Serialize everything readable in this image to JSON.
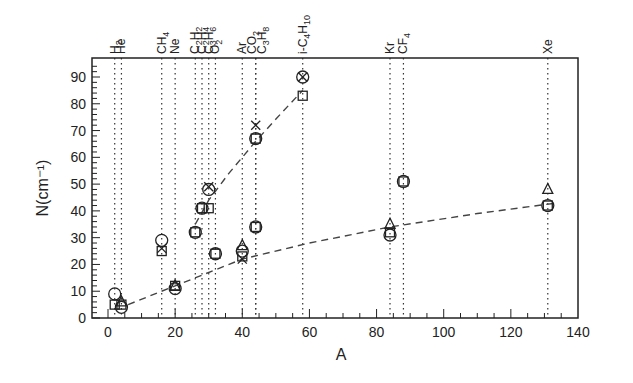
{
  "chart_data": {
    "type": "scatter",
    "title": "",
    "xlabel": "A",
    "ylabel": "N(cm⁻¹)",
    "xlim": [
      0,
      140
    ],
    "ylim": [
      0,
      95
    ],
    "grid": false,
    "xticks": [
      0,
      20,
      40,
      60,
      80,
      100,
      120,
      140
    ],
    "yticks": [
      0,
      10,
      20,
      30,
      40,
      50,
      60,
      70,
      80,
      90
    ],
    "gas_markers": [
      {
        "label": "H2",
        "x": 2
      },
      {
        "label": "He",
        "x": 4
      },
      {
        "label": "CH4",
        "x": 16
      },
      {
        "label": "Ne",
        "x": 20
      },
      {
        "label": "C2H2",
        "x": 26
      },
      {
        "label": "C2H4",
        "x": 28
      },
      {
        "label": "C3H6",
        "x": 30
      },
      {
        "label": "O2",
        "x": 32
      },
      {
        "label": "Ar",
        "x": 40
      },
      {
        "label": "CO2",
        "x": 44
      },
      {
        "label": "C3H8",
        "x": 44
      },
      {
        "label": "i-C4H10",
        "x": 58
      },
      {
        "label": "Kr",
        "x": 84
      },
      {
        "label": "CF4",
        "x": 88
      },
      {
        "label": "Xe",
        "x": 131
      }
    ],
    "series": [
      {
        "name": "circle",
        "marker": "o",
        "points": [
          [
            2,
            9
          ],
          [
            4,
            4
          ],
          [
            16,
            29
          ],
          [
            20,
            11
          ],
          [
            26,
            32
          ],
          [
            28,
            41
          ],
          [
            30,
            48
          ],
          [
            32,
            24
          ],
          [
            40,
            25
          ],
          [
            44,
            34
          ],
          [
            44,
            67
          ],
          [
            58,
            90
          ],
          [
            84,
            31
          ],
          [
            88,
            51
          ],
          [
            131,
            42
          ]
        ]
      },
      {
        "name": "square",
        "marker": "s",
        "points": [
          [
            2,
            5
          ],
          [
            4,
            5
          ],
          [
            16,
            25
          ],
          [
            20,
            12
          ],
          [
            26,
            32
          ],
          [
            28,
            41
          ],
          [
            30,
            41
          ],
          [
            32,
            24
          ],
          [
            40,
            23
          ],
          [
            44,
            34
          ],
          [
            44,
            67
          ],
          [
            58,
            83
          ],
          [
            84,
            32
          ],
          [
            88,
            51
          ],
          [
            131,
            42
          ]
        ]
      },
      {
        "name": "triangle",
        "marker": "^",
        "points": [
          [
            4,
            6
          ],
          [
            20,
            12
          ],
          [
            40,
            27
          ],
          [
            84,
            35
          ],
          [
            131,
            48
          ]
        ]
      },
      {
        "name": "cross",
        "marker": "x",
        "points": [
          [
            16,
            26
          ],
          [
            30,
            49
          ],
          [
            40,
            22
          ],
          [
            44,
            72
          ],
          [
            58,
            90
          ]
        ]
      }
    ],
    "fits": [
      {
        "name": "polyatomic trend",
        "style": "dashed",
        "points": [
          [
            26,
            35
          ],
          [
            30,
            44
          ],
          [
            36,
            54
          ],
          [
            44,
            66
          ],
          [
            52,
            77
          ],
          [
            58,
            85
          ]
        ]
      },
      {
        "name": "noble gas trend",
        "style": "dashed",
        "points": [
          [
            6,
            5
          ],
          [
            20,
            12
          ],
          [
            40,
            22
          ],
          [
            60,
            28
          ],
          [
            84,
            34
          ],
          [
            110,
            39
          ],
          [
            134,
            43
          ]
        ]
      }
    ]
  }
}
